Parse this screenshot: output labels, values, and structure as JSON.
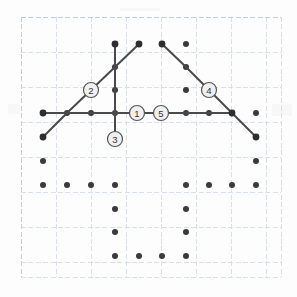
{
  "page": {
    "background_color": "#fdfdfd",
    "width": 297,
    "height": 297
  },
  "graph_paper": {
    "line_color": "#cfd8e3",
    "line_color_strong": "#bcc8d8",
    "spacing": 35,
    "origin_x": 21,
    "origin_y": 17,
    "right": 281,
    "bottom": 277,
    "columns_x": [
      21,
      56,
      91,
      126,
      161,
      196,
      231,
      266,
      281
    ],
    "rows_y": [
      17,
      52,
      87,
      122,
      157,
      192,
      227,
      262,
      277
    ]
  },
  "lattice": {
    "dot_color": "#3a3a3a",
    "dot_radius": 3.0,
    "spacing_x": 23.4,
    "spacing_y": 23.5,
    "dots": [
      {
        "x": 115,
        "y": 44
      },
      {
        "x": 139,
        "y": 44
      },
      {
        "x": 162,
        "y": 44
      },
      {
        "x": 186,
        "y": 44
      },
      {
        "x": 115,
        "y": 67
      },
      {
        "x": 186,
        "y": 67
      },
      {
        "x": 115,
        "y": 90
      },
      {
        "x": 186,
        "y": 90
      },
      {
        "x": 43,
        "y": 113
      },
      {
        "x": 67,
        "y": 113
      },
      {
        "x": 91,
        "y": 113
      },
      {
        "x": 115,
        "y": 113
      },
      {
        "x": 162,
        "y": 113
      },
      {
        "x": 186,
        "y": 113
      },
      {
        "x": 209,
        "y": 113
      },
      {
        "x": 232,
        "y": 113
      },
      {
        "x": 256,
        "y": 113
      },
      {
        "x": 43,
        "y": 137
      },
      {
        "x": 115,
        "y": 137
      },
      {
        "x": 256,
        "y": 137
      },
      {
        "x": 43,
        "y": 161
      },
      {
        "x": 256,
        "y": 161
      },
      {
        "x": 43,
        "y": 185
      },
      {
        "x": 67,
        "y": 185
      },
      {
        "x": 91,
        "y": 185
      },
      {
        "x": 115,
        "y": 185
      },
      {
        "x": 186,
        "y": 185
      },
      {
        "x": 209,
        "y": 185
      },
      {
        "x": 232,
        "y": 185
      },
      {
        "x": 256,
        "y": 185
      },
      {
        "x": 115,
        "y": 209
      },
      {
        "x": 186,
        "y": 209
      },
      {
        "x": 115,
        "y": 232
      },
      {
        "x": 186,
        "y": 232
      },
      {
        "x": 115,
        "y": 256
      },
      {
        "x": 139,
        "y": 256
      },
      {
        "x": 162,
        "y": 256
      },
      {
        "x": 186,
        "y": 256
      }
    ]
  },
  "figure": {
    "stroke_color": "#4a4a4a",
    "stroke_width": 2.0,
    "node_color": "#2e2e2e",
    "node_radius": 3.4,
    "paths": [
      {
        "name": "horizontal-baseline",
        "points": [
          [
            43,
            113
          ],
          [
            67,
            113
          ],
          [
            91,
            113
          ],
          [
            115,
            113
          ],
          [
            162,
            113
          ],
          [
            186,
            113
          ],
          [
            209,
            113
          ],
          [
            232,
            113
          ]
        ]
      },
      {
        "name": "left-ascending-diagonal",
        "points": [
          [
            43,
            137
          ],
          [
            67,
            113
          ],
          [
            91,
            90
          ],
          [
            115,
            67
          ],
          [
            139,
            44
          ]
        ]
      },
      {
        "name": "vertical-stem",
        "points": [
          [
            115,
            44
          ],
          [
            115,
            67
          ],
          [
            115,
            90
          ],
          [
            115,
            113
          ],
          [
            115,
            137
          ]
        ]
      },
      {
        "name": "right-descending-diagonal",
        "points": [
          [
            162,
            44
          ],
          [
            186,
            67
          ],
          [
            209,
            90
          ],
          [
            232,
            113
          ],
          [
            256,
            137
          ]
        ]
      }
    ],
    "endpoints": [
      {
        "x": 43,
        "y": 113
      },
      {
        "x": 232,
        "y": 113
      },
      {
        "x": 43,
        "y": 137
      },
      {
        "x": 139,
        "y": 44
      },
      {
        "x": 115,
        "y": 44
      },
      {
        "x": 115,
        "y": 137
      },
      {
        "x": 162,
        "y": 44
      },
      {
        "x": 256,
        "y": 137
      }
    ]
  },
  "annotations": {
    "circle_fill": "#f0f0f0",
    "circle_stroke": "#555555",
    "circle_radius": 7.5,
    "text_color": "#333333",
    "items": [
      {
        "id": "callout-1",
        "label": "1",
        "x": 137,
        "y": 113
      },
      {
        "id": "callout-2",
        "label": "2",
        "x": 91,
        "y": 90
      },
      {
        "id": "callout-3",
        "label": "3",
        "x": 115,
        "y": 139
      },
      {
        "id": "callout-4",
        "label": "4",
        "x": 209,
        "y": 90
      },
      {
        "id": "callout-5",
        "label": "5",
        "x": 161,
        "y": 113
      }
    ]
  }
}
